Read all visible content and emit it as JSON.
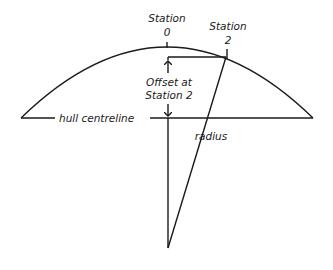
{
  "diagram": {
    "labels": {
      "station0_line1": "Station",
      "station0_line2": "0",
      "station2_line1": "Station",
      "station2_line2": "2",
      "offset_line1": "Offset at",
      "offset_line2": "Station 2",
      "centreline": "hull centreline",
      "radius": "radius"
    },
    "colors": {
      "stroke": "#1a1a1a",
      "background": "#ffffff"
    }
  }
}
